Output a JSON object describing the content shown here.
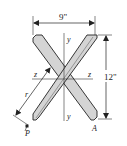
{
  "diagram": {
    "type": "cross-section",
    "shape": "X-shaped section (two crossed flat bars)",
    "dimensions": {
      "width_label": "9\"",
      "height_label": "12\""
    },
    "axes": {
      "vertical_top": "y",
      "vertical_bottom": "y",
      "horizontal_left": "z",
      "horizontal_right": "z"
    },
    "points": {
      "p": "P",
      "a": "A"
    },
    "radius_label": "r",
    "colors": {
      "fill": "#d4d4d4",
      "stroke": "#222222",
      "background": "#ffffff"
    }
  }
}
